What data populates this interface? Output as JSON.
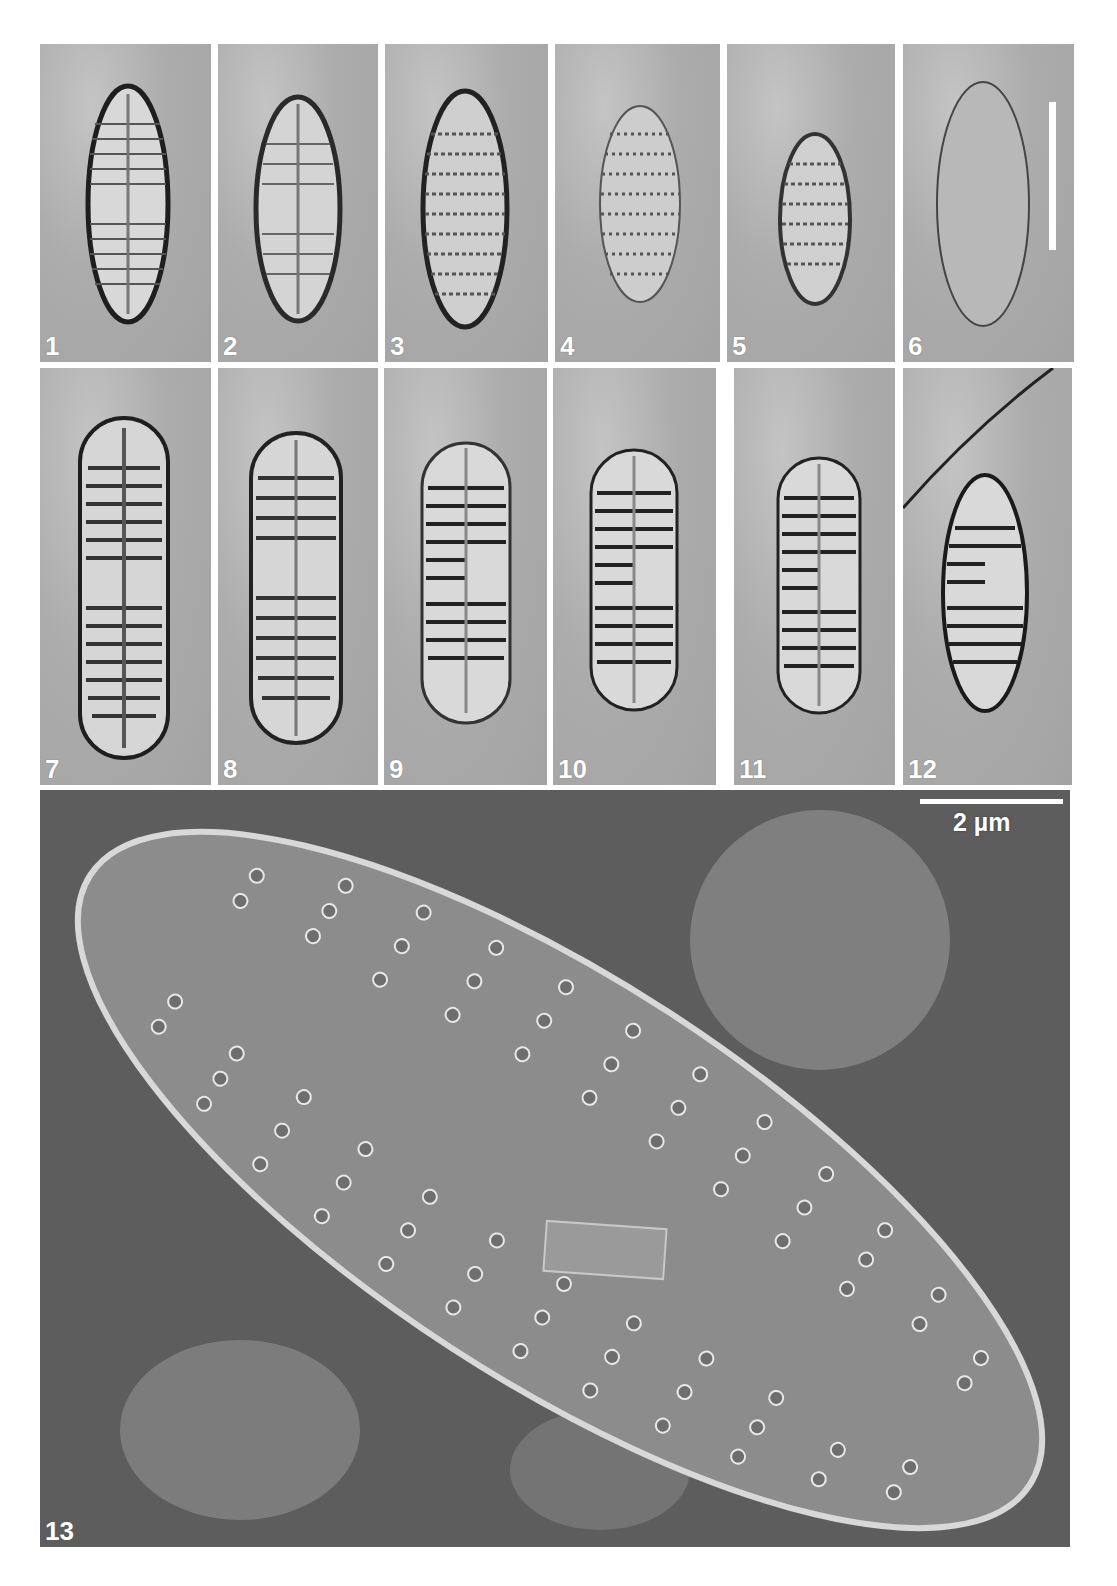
{
  "figure": {
    "panels": [
      {
        "id": "1",
        "label": "1",
        "type": "LM",
        "valve": "lanceolate, fine radiate striae, linear raphe"
      },
      {
        "id": "2",
        "label": "2",
        "type": "LM",
        "valve": "lanceolate, radiate striae"
      },
      {
        "id": "3",
        "label": "3",
        "type": "LM",
        "valve": "lanceolate, punctate striae"
      },
      {
        "id": "4",
        "label": "4",
        "type": "LM",
        "valve": "elliptic, punctate striae"
      },
      {
        "id": "5",
        "label": "5",
        "type": "LM",
        "valve": "elliptic, short valve"
      },
      {
        "id": "6",
        "label": "6",
        "type": "LM",
        "valve": "girdle/hyaline valve outline",
        "scale_bar": "vertical white bar"
      },
      {
        "id": "7",
        "label": "7",
        "type": "LM",
        "valve": "linear-lanceolate, coarse striae"
      },
      {
        "id": "8",
        "label": "8",
        "type": "LM",
        "valve": "linear-lanceolate, coarse striae"
      },
      {
        "id": "9",
        "label": "9",
        "type": "LM",
        "valve": "lanceolate, coarse striae, central area"
      },
      {
        "id": "10",
        "label": "10",
        "type": "LM",
        "valve": "lanceolate, coarse striae, central area"
      },
      {
        "id": "11",
        "label": "11",
        "type": "LM",
        "valve": "lanceolate, coarse striae, central area"
      },
      {
        "id": "12",
        "label": "12",
        "type": "LM",
        "valve": "elliptic-lanceolate, coarse striae"
      },
      {
        "id": "13",
        "label": "13",
        "type": "SEM",
        "valve": "external view, biseriate striae of round areolae",
        "scale_bar": "2 µm"
      }
    ],
    "scale_bar_sem_label": "2 µm",
    "colors": {
      "background": "#ffffff",
      "lm_background": "#aaaaaa",
      "sem_background": "#5d5d5d",
      "valve_face_sem": "#8a8a8a",
      "label_text": "#ffffff"
    }
  }
}
